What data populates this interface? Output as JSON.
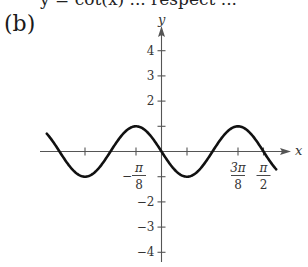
{
  "header": {
    "cut_off_text": "y = cot(x) ... respect ...",
    "part_label": "(b)"
  },
  "chart_data": {
    "type": "line",
    "title": "",
    "xlabel": "x",
    "ylabel": "y",
    "function": "y = -sin(4x)",
    "xlim_pi_over_8_units": [
      -4.5,
      4.5
    ],
    "ylim": [
      -4.4,
      4.9
    ],
    "grid": false,
    "legend": null,
    "x_ticks": [
      {
        "value_pi_over_8": -3,
        "label": ""
      },
      {
        "value_pi_over_8": -1,
        "label": "-π/8",
        "num": "π",
        "den": "8",
        "sign": "−"
      },
      {
        "value_pi_over_8": 1,
        "label": ""
      },
      {
        "value_pi_over_8": 3,
        "label": "3π/8",
        "num": "3π",
        "den": "8",
        "sign": ""
      },
      {
        "value_pi_over_8": 4,
        "label": "π/2",
        "num": "π",
        "den": "2",
        "sign": ""
      }
    ],
    "y_ticks": [
      {
        "value": 4,
        "label": "4"
      },
      {
        "value": 3,
        "label": "3"
      },
      {
        "value": 2,
        "label": "2"
      },
      {
        "value": 1,
        "label": ""
      },
      {
        "value": -1,
        "label": ""
      },
      {
        "value": -2,
        "label": "−2"
      },
      {
        "value": -3,
        "label": "−3"
      },
      {
        "value": -4,
        "label": "−4"
      }
    ],
    "key_points": [
      {
        "x": "-3π/8",
        "y": -1
      },
      {
        "x": "-π/4",
        "y": 0
      },
      {
        "x": "-π/8",
        "y": 1
      },
      {
        "x": "0",
        "y": 0
      },
      {
        "x": "π/8",
        "y": -1
      },
      {
        "x": "π/4",
        "y": 0
      },
      {
        "x": "3π/8",
        "y": 1
      },
      {
        "x": "π/2",
        "y": 0
      }
    ]
  },
  "colors": {
    "curve": "#111111",
    "axis": "#555555",
    "text": "#333333"
  }
}
